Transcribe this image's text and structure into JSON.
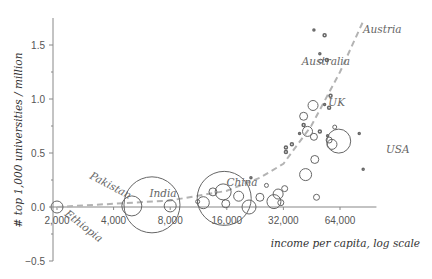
{
  "chart_data": {
    "type": "scatter",
    "subtype": "bubble",
    "title": "",
    "xlabel": "income per capita, log scale",
    "ylabel": "# top 1,000 universities / million",
    "x_scale": "log2",
    "xlim": [
      1950,
      100000
    ],
    "ylim": [
      -0.5,
      1.75
    ],
    "x_ticks": [
      2000,
      4000,
      8000,
      16000,
      32000,
      64000
    ],
    "x_tick_labels": [
      "2,000",
      "4,000",
      "8,000",
      "16,000",
      "32,000",
      "64,000"
    ],
    "y_ticks": [
      -0.5,
      0.0,
      0.5,
      1.0,
      1.5
    ],
    "y_tick_labels": [
      "−0.5",
      "0.0",
      "0.5",
      "1.0",
      "1.5"
    ],
    "y_minor_ticks": [
      -0.25,
      0.25,
      0.75,
      1.25
    ],
    "grid": false,
    "legend": null,
    "colors": {
      "points": "#666666",
      "axis": "#888888",
      "trend": "#b3b3b3",
      "labels": "#666666"
    },
    "trend_line": {
      "style": "dashed",
      "description": "exponential fit",
      "points": [
        [
          2000,
          0.0
        ],
        [
          8000,
          0.06
        ],
        [
          16000,
          0.15
        ],
        [
          24000,
          0.27
        ],
        [
          32000,
          0.4
        ],
        [
          45000,
          0.75
        ],
        [
          64000,
          1.25
        ],
        [
          85000,
          1.72
        ]
      ]
    },
    "points": [
      {
        "label": "Ethiopia",
        "x": 2000,
        "y": 0.0,
        "r": 6
      },
      {
        "label": "Pakistan",
        "x": 5000,
        "y": 0.01,
        "r": 10
      },
      {
        "label": "India",
        "x": 6400,
        "y": 0.02,
        "r": 28
      },
      {
        "label": "",
        "x": 8000,
        "y": 0.01,
        "r": 6
      },
      {
        "label": "",
        "x": 11200,
        "y": 0.05,
        "r": 2
      },
      {
        "label": "",
        "x": 12000,
        "y": 0.04,
        "r": 6
      },
      {
        "label": "",
        "x": 13500,
        "y": 0.14,
        "r": 4
      },
      {
        "label": "China",
        "x": 15500,
        "y": 0.08,
        "r": 27
      },
      {
        "label": "",
        "x": 15300,
        "y": 0.14,
        "r": 8
      },
      {
        "label": "",
        "x": 15800,
        "y": 0.03,
        "r": 4
      },
      {
        "label": "",
        "x": 18500,
        "y": 0.1,
        "r": 5
      },
      {
        "label": "",
        "x": 21000,
        "y": 0.0,
        "r": 7
      },
      {
        "label": "",
        "x": 21500,
        "y": 0.27,
        "r": 1
      },
      {
        "label": "",
        "x": 24000,
        "y": 0.09,
        "r": 4
      },
      {
        "label": "",
        "x": 26000,
        "y": 0.2,
        "r": 2
      },
      {
        "label": "",
        "x": 28500,
        "y": 0.05,
        "r": 7
      },
      {
        "label": "",
        "x": 30000,
        "y": 0.12,
        "r": 5
      },
      {
        "label": "",
        "x": 31000,
        "y": 0.04,
        "r": 3
      },
      {
        "label": "",
        "x": 32500,
        "y": 0.17,
        "r": 3
      },
      {
        "label": "",
        "x": 33000,
        "y": 0.51,
        "r": 1.5
      },
      {
        "label": "",
        "x": 33000,
        "y": 0.55,
        "r": 1.5
      },
      {
        "label": "",
        "x": 35500,
        "y": 0.58,
        "r": 1.5
      },
      {
        "label": "",
        "x": 39000,
        "y": 0.68,
        "r": 1
      },
      {
        "label": "",
        "x": 41000,
        "y": 0.84,
        "r": 4
      },
      {
        "label": "",
        "x": 43000,
        "y": 0.7,
        "r": 5
      },
      {
        "label": "",
        "x": 41000,
        "y": 0.76,
        "r": 1.5
      },
      {
        "label": "",
        "x": 42000,
        "y": 0.3,
        "r": 6
      },
      {
        "label": "",
        "x": 47000,
        "y": 0.44,
        "r": 4
      },
      {
        "label": "",
        "x": 48000,
        "y": 0.09,
        "r": 3
      },
      {
        "label": "",
        "x": 46500,
        "y": 0.65,
        "r": 3.5
      },
      {
        "label": "",
        "x": 50000,
        "y": 0.7,
        "r": 1.5
      },
      {
        "label": "UK",
        "x": 46000,
        "y": 0.94,
        "r": 5
      },
      {
        "label": "",
        "x": 53000,
        "y": 0.95,
        "r": 1
      },
      {
        "label": "",
        "x": 56000,
        "y": 0.92,
        "r": 1.5
      },
      {
        "label": "",
        "x": 57000,
        "y": 1.03,
        "r": 1.5
      },
      {
        "label": "",
        "x": 55000,
        "y": 0.66,
        "r": 1
      },
      {
        "label": "",
        "x": 56000,
        "y": 0.62,
        "r": 3
      },
      {
        "label": "",
        "x": 58000,
        "y": 0.58,
        "r": 5
      },
      {
        "label": "USA",
        "x": 63000,
        "y": 0.61,
        "r": 12
      },
      {
        "label": "",
        "x": 60000,
        "y": 0.74,
        "r": 2
      },
      {
        "label": "Australia",
        "x": 50500,
        "y": 1.35,
        "r": 2
      },
      {
        "label": "",
        "x": 50000,
        "y": 1.42,
        "r": 1
      },
      {
        "label": "",
        "x": 54500,
        "y": 1.36,
        "r": 1.5
      },
      {
        "label": "Austria",
        "x": 53000,
        "y": 1.59,
        "r": 1.5
      },
      {
        "label": "",
        "x": 46500,
        "y": 1.64,
        "r": 1
      },
      {
        "label": "",
        "x": 81000,
        "y": 0.68,
        "r": 1
      },
      {
        "label": "",
        "x": 85000,
        "y": 0.35,
        "r": 1
      }
    ],
    "annotations": [
      {
        "text": "Ethiopia",
        "rotation": 38
      },
      {
        "text": "Pakistan",
        "rotation": 28
      },
      {
        "text": "India",
        "rotation": 0
      },
      {
        "text": "China",
        "rotation": 0
      },
      {
        "text": "UK",
        "rotation": 0
      },
      {
        "text": "USA",
        "rotation": 0
      },
      {
        "text": "Australia",
        "rotation": 0
      },
      {
        "text": "Austria",
        "rotation": 0
      }
    ]
  }
}
